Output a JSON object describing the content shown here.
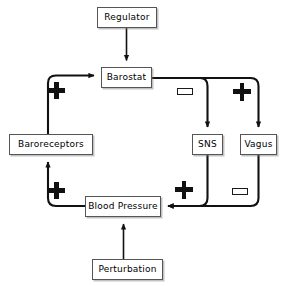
{
  "diagram": {
    "background_color": "#ffffff",
    "line_color": "#111111",
    "node_border_color": "#555555",
    "node_fill_color": "#ffffff",
    "nodes": [
      {
        "id": "regulator",
        "label": "Regulator",
        "x": 97,
        "y": 7,
        "w": 60,
        "h": 21
      },
      {
        "id": "barostat",
        "label": "Barostat",
        "x": 101,
        "y": 67,
        "w": 51,
        "h": 21
      },
      {
        "id": "baroreceptors",
        "label": "Baroreceptors",
        "x": 9,
        "y": 134,
        "w": 84,
        "h": 21
      },
      {
        "id": "sns",
        "label": "SNS",
        "x": 192,
        "y": 134,
        "w": 31,
        "h": 21
      },
      {
        "id": "vagus",
        "label": "Vagus",
        "x": 240,
        "y": 134,
        "w": 37,
        "h": 21
      },
      {
        "id": "blood-pressure",
        "label": "Blood Pressure",
        "x": 85,
        "y": 196,
        "w": 76,
        "h": 21
      },
      {
        "id": "perturbation",
        "label": "Perturbation",
        "x": 92,
        "y": 259,
        "w": 71,
        "h": 21
      }
    ],
    "signs": [
      {
        "id": "sign-baroreceptors-to-barostat",
        "type": "plus",
        "symbol": "+",
        "x": 48,
        "y": 82,
        "edge": "baroreceptors -> barostat"
      },
      {
        "id": "sign-barostat-to-sns",
        "type": "minus",
        "symbol": "−",
        "x": 177,
        "y": 88,
        "edge": "barostat -> SNS"
      },
      {
        "id": "sign-barostat-to-vagus",
        "type": "plus",
        "symbol": "+",
        "x": 233,
        "y": 83,
        "edge": "barostat -> Vagus"
      },
      {
        "id": "sign-bloodpressure-to-baroreceptors",
        "type": "plus",
        "symbol": "+",
        "x": 48,
        "y": 182,
        "edge": "blood pressure -> baroreceptors"
      },
      {
        "id": "sign-sns-to-bloodpressure",
        "type": "plus",
        "symbol": "+",
        "x": 175,
        "y": 181,
        "edge": "SNS -> blood pressure"
      },
      {
        "id": "sign-vagus-to-bloodpressure",
        "type": "minus",
        "symbol": "−",
        "x": 232,
        "y": 188,
        "edge": "Vagus -> blood pressure"
      }
    ],
    "edges": [
      {
        "id": "edge-regulator-barostat",
        "from": "Regulator",
        "to": "Barostat",
        "sign": ""
      },
      {
        "id": "edge-baroreceptors-barostat",
        "from": "Baroreceptors",
        "to": "Barostat",
        "sign": "+"
      },
      {
        "id": "edge-barostat-sns",
        "from": "Barostat",
        "to": "SNS",
        "sign": "−"
      },
      {
        "id": "edge-barostat-vagus",
        "from": "Barostat",
        "to": "Vagus",
        "sign": "+"
      },
      {
        "id": "edge-sns-blood-pressure",
        "from": "SNS",
        "to": "Blood Pressure",
        "sign": "+"
      },
      {
        "id": "edge-vagus-blood-pressure",
        "from": "Vagus",
        "to": "Blood Pressure",
        "sign": "−"
      },
      {
        "id": "edge-blood-pressure-baroreceptors",
        "from": "Blood Pressure",
        "to": "Baroreceptors",
        "sign": "+"
      },
      {
        "id": "edge-perturbation-blood-pressure",
        "from": "Perturbation",
        "to": "Blood Pressure",
        "sign": ""
      }
    ]
  }
}
